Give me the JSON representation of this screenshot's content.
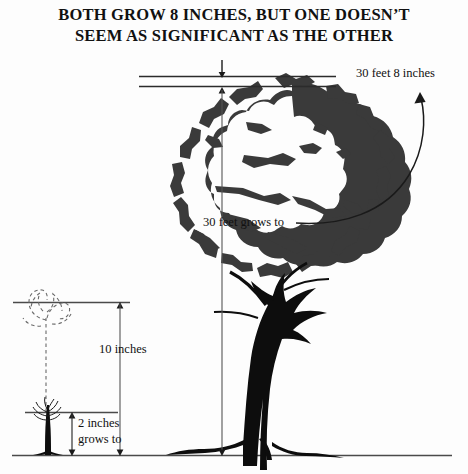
{
  "title": {
    "line1": "BOTH GROW 8 INCHES, BUT ONE DOESN’T",
    "line2": "SEEM AS SIGNIFICANT AS THE OTHER"
  },
  "annotations": {
    "tree_top_label": "30 feet 8 inches",
    "tree_grows_label": "30 feet grows to",
    "sapling_total_label": "10 inches",
    "sapling_base_label_line1": "2 inches",
    "sapling_base_label_line2": "grows to"
  },
  "figure": {
    "tree_name": "large-oak-tree",
    "sapling_name": "small-seedling",
    "sapling_ghost_name": "grown-seedling-dashed-outline",
    "ground_line_name": "ground-line"
  },
  "colors": {
    "ink": "#111111",
    "foliage": "#3a3a3a",
    "trunk": "#0d0d0d",
    "rule": "#2b2b2b",
    "dashed": "#6a6a6a",
    "background": "#fdfdfd"
  },
  "measurements": {
    "tree_total": "30 feet 8 inches",
    "tree_before": "30 feet",
    "sapling_total": "10 inches",
    "sapling_before": "2 inches",
    "growth": "8 inches"
  }
}
